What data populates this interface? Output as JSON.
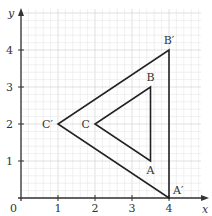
{
  "diagram": {
    "type": "coordinate-grid-enlargement",
    "axes": {
      "x_label": "x",
      "y_label": "y",
      "origin_label": "0",
      "x_range": [
        0,
        4.5
      ],
      "y_range": [
        0,
        5
      ],
      "x_ticks": [
        "1",
        "2",
        "3",
        "4"
      ],
      "y_ticks": [
        "1",
        "2",
        "3",
        "4"
      ],
      "minor_step": 0.2
    },
    "triangles": [
      {
        "name": "ABC",
        "vertices": [
          {
            "label": "A",
            "x": 3.5,
            "y": 1
          },
          {
            "label": "B",
            "x": 3.5,
            "y": 3
          },
          {
            "label": "C",
            "x": 2,
            "y": 2
          }
        ]
      },
      {
        "name": "A'B'C'",
        "vertices": [
          {
            "label": "A′",
            "x": 4,
            "y": 0
          },
          {
            "label": "B′",
            "x": 4,
            "y": 4
          },
          {
            "label": "C′",
            "x": 1,
            "y": 2
          }
        ]
      }
    ],
    "colors": {
      "grid_minor": "#e6e6e6",
      "grid_major": "#cfcfcf",
      "axis": "#333333",
      "shape": "#222222"
    }
  }
}
